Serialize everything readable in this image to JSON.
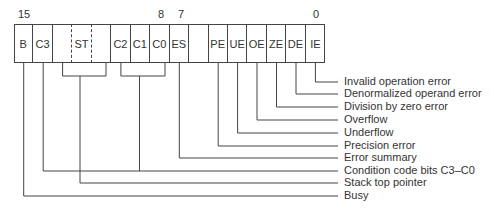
{
  "register": {
    "bit_numbers": [
      {
        "text": "15",
        "x": 24
      },
      {
        "text": "8",
        "x": 161
      },
      {
        "text": "7",
        "x": 181
      },
      {
        "text": "0",
        "x": 316
      }
    ],
    "cells": [
      {
        "label": "B"
      },
      {
        "label": "C3"
      },
      {
        "label": ""
      },
      {
        "label": "ST"
      },
      {
        "label": ""
      },
      {
        "label": "C2"
      },
      {
        "label": "C1"
      },
      {
        "label": "C0"
      },
      {
        "label": "ES"
      },
      {
        "label": ""
      },
      {
        "label": "PE"
      },
      {
        "label": "UE"
      },
      {
        "label": "OE"
      },
      {
        "label": "ZE"
      },
      {
        "label": "DE"
      },
      {
        "label": "IE"
      }
    ]
  },
  "legend": [
    {
      "text": "Invalid operation error",
      "y": 82
    },
    {
      "text": "Denormalized operand error",
      "y": 94
    },
    {
      "text": "Division by zero error",
      "y": 107
    },
    {
      "text": "Overflow",
      "y": 120
    },
    {
      "text": "Underflow",
      "y": 133
    },
    {
      "text": "Precision error",
      "y": 146
    },
    {
      "text": "Error summary",
      "y": 158
    },
    {
      "text": "Condition code bits C3–C0",
      "y": 171
    },
    {
      "text": "Stack top pointer",
      "y": 183
    },
    {
      "text": "Busy",
      "y": 196
    }
  ]
}
